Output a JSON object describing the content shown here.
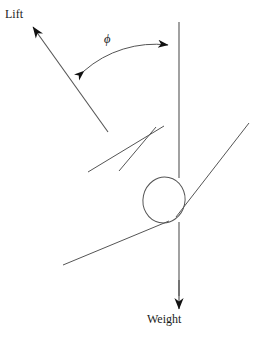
{
  "diagram": {
    "background_color": "#ffffff",
    "stroke_color": "#555555",
    "arrow_color": "#111111",
    "text_color": "#1a1a1a",
    "labels": {
      "lift": "Lift",
      "weight": "Weight",
      "angle": "ϕ"
    },
    "elements": {
      "lift_vector": {
        "name": "lift-force-arrow",
        "from": [
          108,
          132
        ],
        "to": [
          31,
          25
        ],
        "arrowhead": "tip-at-to"
      },
      "vertical_reference_line": {
        "name": "vertical-reference-line",
        "from": [
          179,
          22
        ],
        "to": [
          179,
          300
        ]
      },
      "weight_vector": {
        "name": "weight-force-arrow",
        "from": [
          179,
          222
        ],
        "to": [
          179,
          310
        ],
        "arrowhead": "tip-at-to"
      },
      "angle_arc": {
        "name": "phi-angle-arc",
        "start": [
          80,
          73
        ],
        "end": [
          172,
          45
        ],
        "double_headed": true
      },
      "balloon_envelope": {
        "name": "balloon-envelope-ellipse",
        "center": [
          164,
          200
        ],
        "rx": 21,
        "ry": 23,
        "rotation_deg": 12
      },
      "rigging_lines": [
        {
          "name": "rigging-line-upper-left",
          "from": [
            88,
            172
          ],
          "to": [
            163,
            127
          ]
        },
        {
          "name": "rigging-line-lower-left",
          "from": [
            120,
            170
          ],
          "to": [
            155,
            128
          ]
        },
        {
          "name": "rigging-line-upper-right",
          "from": [
            176,
            216
          ],
          "to": [
            249,
            123
          ]
        },
        {
          "name": "rigging-line-basket-left",
          "from": [
            63,
            265
          ],
          "to": [
            168,
            221
          ]
        }
      ]
    },
    "axis_ranges": {
      "width": 269,
      "height": 342
    }
  }
}
